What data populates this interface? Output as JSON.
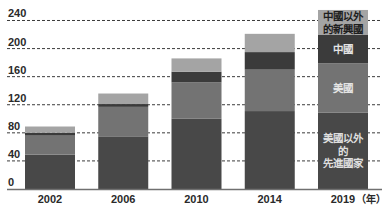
{
  "chart_data": {
    "type": "bar",
    "stacked": true,
    "title": "",
    "xlabel": "",
    "ylabel": "",
    "x_unit_label": "（年）",
    "categories": [
      "2002",
      "2006",
      "2010",
      "2014",
      "2019"
    ],
    "series": [
      {
        "name": "美國以外的先進國家",
        "label_lines": [
          "美國以外",
          "的",
          "先進國家"
        ],
        "color": "#484848",
        "label_color": "#dedede",
        "values": [
          49,
          75,
          100,
          111,
          109
        ]
      },
      {
        "name": "美國",
        "label_lines": [
          "美國"
        ],
        "color": "#737373",
        "label_color": "#e4e4e4",
        "values": [
          27,
          42,
          52,
          59,
          70
        ]
      },
      {
        "name": "中國",
        "label_lines": [
          "中國"
        ],
        "color": "#3b3b3b",
        "label_color": "#e4e4e4",
        "values": [
          4,
          4,
          15,
          25,
          41
        ]
      },
      {
        "name": "中國以外的新興國",
        "label_lines": [
          "中國以外",
          "的新興國"
        ],
        "color": "#a4a4a4",
        "label_color": "#1e1e1e",
        "values": [
          9,
          15,
          19,
          26,
          35
        ]
      }
    ],
    "totals": [
      89,
      136,
      186,
      221,
      255
    ],
    "yticks": [
      "0",
      "40",
      "80",
      "120",
      "160",
      "200",
      "240"
    ],
    "ylim": [
      0,
      240
    ],
    "grid": true,
    "grid_style": "dashed",
    "legend": "inline labels inside the 2019 bar",
    "colors": {
      "grid": "#3c3c3c",
      "baseline": "#707070",
      "text": "#2a2a2a"
    }
  }
}
